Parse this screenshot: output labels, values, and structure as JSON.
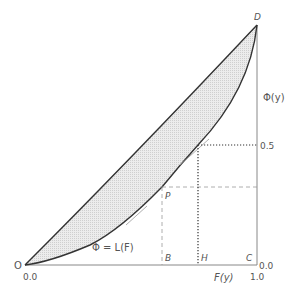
{
  "diagram": {
    "type": "lorenz-curve",
    "points": {
      "origin": "O",
      "top_right": "D",
      "bottom_right": "C",
      "point_on_curve": "P",
      "foot_of_P": "B",
      "foot_of_half": "H"
    },
    "curve_label": "Φ = L(F)",
    "x_axis_label": "F(y)",
    "y_axis_label": "Φ(y)",
    "x_ticks": [
      "0.0",
      "1.0"
    ],
    "y_ticks": [
      "0.0",
      "0.5"
    ],
    "colors": {
      "line": "#333333",
      "fill": "#e0e0e0",
      "axis": "#888888",
      "text": "#555555"
    }
  }
}
